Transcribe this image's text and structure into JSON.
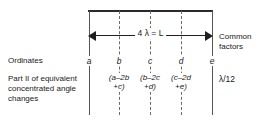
{
  "figure": {
    "type": "engineering-ordinate-diagram",
    "colors": {
      "ink": "#1a1a1a",
      "rule": "#2b2b2b",
      "line": "#555555",
      "dashed": "#6a6a6a",
      "background": "#ffffff"
    },
    "dimension": {
      "label": "4 λ = L",
      "arrow_left": "◀",
      "arrow_right": "▶",
      "span_from": "a",
      "span_to": "e"
    },
    "row_labels": {
      "ordinates": "Ordinates",
      "part_ii": "Part II of equivalent concentrated angle changes"
    },
    "right_labels": {
      "common_factors": "Common factors",
      "lambda_factor": "λ/12"
    },
    "ordinates": [
      {
        "name": "a",
        "x": 89,
        "style": "solid"
      },
      {
        "name": "b",
        "x": 119,
        "style": "dashed"
      },
      {
        "name": "c",
        "x": 150,
        "style": "dashed"
      },
      {
        "name": "d",
        "x": 181,
        "style": "dashed"
      },
      {
        "name": "e",
        "x": 212,
        "style": "solid"
      }
    ],
    "groups": [
      {
        "x": 119,
        "line1": "(a–2b",
        "line2": "+c)"
      },
      {
        "x": 150,
        "line1": "(b–2c",
        "line2": "+d)"
      },
      {
        "x": 181,
        "line1": "(c–2d",
        "line2": "+e)"
      }
    ]
  }
}
